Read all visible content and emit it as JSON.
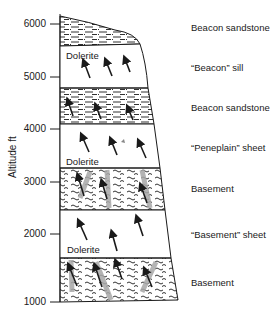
{
  "axis": {
    "unit_label": "Altitude ft",
    "ticks": [
      "6000",
      "5000",
      "4000",
      "3000",
      "2000",
      "1000"
    ]
  },
  "column": {
    "rock_labels": [
      "Dolerite",
      "Dolerite",
      "Dolerite"
    ],
    "layers": [
      {
        "name": "Beacon sandstone"
      },
      {
        "name": "“Beacon”  sill"
      },
      {
        "name": "Beacon sandstone"
      },
      {
        "name": "“Peneplain”  sheet"
      },
      {
        "name": "Basement"
      },
      {
        "name": "“Basement”  sheet"
      },
      {
        "name": "Basement"
      }
    ]
  },
  "colors": {
    "ink": "#1a1a1a",
    "hatch": "#9a9a9a",
    "background": "#ffffff"
  }
}
